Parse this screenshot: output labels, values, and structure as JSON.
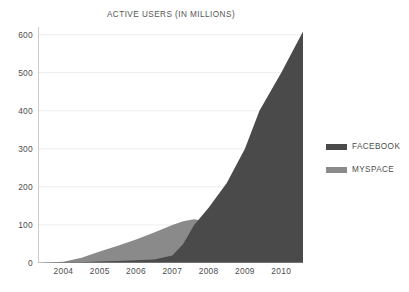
{
  "chart_data": {
    "type": "area",
    "title": "ACTIVE USERS (IN MILLIONS)",
    "xlabel": "",
    "ylabel": "",
    "stacked": false,
    "grid": true,
    "legend_position": "right",
    "xlim": [
      2003.3,
      2010.6
    ],
    "ylim": [
      0,
      620
    ],
    "yticks": [
      0,
      100,
      200,
      300,
      400,
      500,
      600
    ],
    "ytick_labels": [
      "0",
      "100",
      "200",
      "300",
      "400",
      "500",
      "600"
    ],
    "xticks": [
      2004,
      2005,
      2006,
      2007,
      2008,
      2009,
      2010
    ],
    "xtick_labels": [
      "2004",
      "2005",
      "2006",
      "2007",
      "2008",
      "2009",
      "2010"
    ],
    "x": [
      2003.3,
      2004.0,
      2004.5,
      2005.0,
      2005.5,
      2006.0,
      2006.5,
      2007.0,
      2007.3,
      2007.6,
      2008.0,
      2008.5,
      2009.0,
      2009.4,
      2010.0,
      2010.6
    ],
    "series": [
      {
        "name": "FACEBOOK",
        "color": "#4a4a4a",
        "values": [
          0,
          1,
          2,
          4,
          5,
          7,
          9,
          20,
          50,
          100,
          145,
          210,
          300,
          400,
          500,
          608
        ]
      },
      {
        "name": "MYSPACE",
        "color": "#8a8a8a",
        "values": [
          0,
          3,
          14,
          30,
          45,
          62,
          80,
          100,
          110,
          115,
          108,
          85,
          68,
          55,
          44,
          35
        ]
      }
    ],
    "colors": {
      "facebook": "#4a4a4a",
      "myspace": "#8a8a8a",
      "grid": "#ededed",
      "axis": "#9a9a9a",
      "text": "#4d4d4d",
      "background": "#ffffff"
    }
  },
  "legend": {
    "items": [
      {
        "label": "FACEBOOK",
        "swatch": "#4a4a4a"
      },
      {
        "label": "MYSPACE",
        "swatch": "#8a8a8a"
      }
    ]
  }
}
